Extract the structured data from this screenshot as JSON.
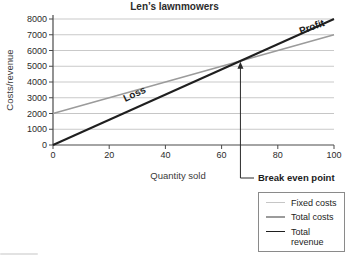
{
  "chart_data": {
    "type": "line",
    "title": "Len’s lawnmowers",
    "xlabel": "Quantity sold",
    "ylabel": "Costs/revenue",
    "xlim": [
      0,
      100
    ],
    "ylim": [
      0,
      8000
    ],
    "xticks": [
      0,
      20,
      40,
      60,
      80,
      100
    ],
    "yticks": [
      0,
      1000,
      2000,
      3000,
      4000,
      5000,
      6000,
      7000,
      8000
    ],
    "grid": "horizontal",
    "legend_position": "outside-bottom-right",
    "axis_color": "#4a4a4a",
    "grid_color": "#c9c9c9",
    "series": [
      {
        "name": "Fixed costs",
        "color": "#c6c6c6",
        "width": 1.2,
        "points": [
          [
            0,
            2000
          ],
          [
            100,
            2000
          ]
        ]
      },
      {
        "name": "Total costs",
        "color": "#9b9b9b",
        "width": 1.6,
        "points": [
          [
            0,
            2000
          ],
          [
            100,
            7000
          ]
        ]
      },
      {
        "name": "Total revenue",
        "color": "#1f1f1f",
        "width": 2,
        "points": [
          [
            0,
            0
          ],
          [
            100,
            8000
          ]
        ]
      }
    ],
    "region_labels": [
      {
        "text": "Loss",
        "x": 29.5,
        "y": 3050,
        "angle": -25
      },
      {
        "text": "Profit",
        "x": 92.5,
        "y": 7300,
        "angle": -20
      }
    ],
    "break_even": {
      "label": "Break even point",
      "x": 66.7,
      "y": 5350
    }
  }
}
